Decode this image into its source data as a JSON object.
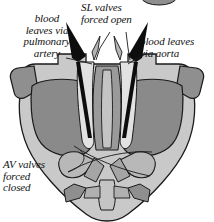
{
  "figure": {
    "width": 214,
    "height": 222,
    "background": "#ffffff"
  },
  "labels": {
    "pulmonary": "blood\nleaves via\npulmonary\nartery",
    "sl_valves": "SL valves\nforced open",
    "aorta": "blood leaves\nvia aorta",
    "av_valves": "AV valves\nforced\nclosed"
  },
  "colors": {
    "outer_wall": "#c9c9c9",
    "chamber_fill": "#8a8a8a",
    "inner_lumen": "#dcdcdc",
    "septum": "#9a9a9a",
    "vessel_stub": "#8f8f8f",
    "arrow": "#0d0d0d",
    "outline": "#1a1a1a",
    "text": "#111111",
    "leader_line": "#1a1a1a",
    "top_ellipse": "#8f8f8f"
  },
  "annotations": {
    "arrows": [
      {
        "name": "pulmonary-outflow-arrow",
        "direction": "up-left"
      },
      {
        "name": "aortic-outflow-arrow",
        "direction": "up-right"
      }
    ],
    "leader_lines": [
      {
        "from": "label-pulmonary",
        "to": "pulmonary-valve"
      },
      {
        "from": "label-sl-valves",
        "to": "left-semilunar-valve"
      },
      {
        "from": "label-sl-valves",
        "to": "right-semilunar-valve"
      },
      {
        "from": "label-aorta",
        "to": "aortic-valve"
      },
      {
        "from": "label-av-valves",
        "to": "left-av-valve-cusp"
      },
      {
        "from": "label-av-valves",
        "to": "right-av-valve-cusp"
      }
    ]
  }
}
